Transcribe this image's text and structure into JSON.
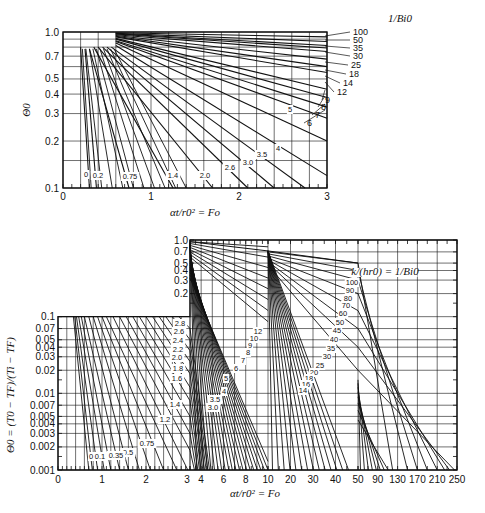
{
  "chart_data": [
    {
      "type": "line",
      "title": "Centerline temperature of an infinite cylinder (short time)",
      "xlabel": "αt/r0² = Fo",
      "ylabel": "Θ0",
      "xscale": "linear",
      "yscale": "log",
      "xlim": [
        0,
        3
      ],
      "ylim": [
        0.1,
        1.0
      ],
      "x_ticks": [
        "0",
        "1",
        "2",
        "3"
      ],
      "y_ticks": [
        "0.1",
        "0.2",
        "0.3",
        "0.4",
        "0.5",
        "0.7",
        "1.0"
      ],
      "legend_title": "1/Bi0",
      "grid": true,
      "series": [
        {
          "name": "0",
          "x": [
            0.2,
            0.3
          ],
          "values": [
            0.8,
            0.1
          ]
        },
        {
          "name": "0.2",
          "x": [
            0.25,
            0.38
          ],
          "values": [
            0.78,
            0.1
          ]
        },
        {
          "name": "0.75",
          "x": [
            0.3,
            0.75
          ],
          "values": [
            0.78,
            0.1
          ]
        },
        {
          "name": "1.4",
          "x": [
            0.35,
            1.25
          ],
          "values": [
            0.8,
            0.1
          ]
        },
        {
          "name": "2.0",
          "x": [
            0.4,
            1.7
          ],
          "values": [
            0.8,
            0.1
          ]
        },
        {
          "name": "2.6",
          "x": [
            0.45,
            2.1
          ],
          "values": [
            0.8,
            0.1
          ]
        },
        {
          "name": "3.0",
          "x": [
            0.5,
            2.4
          ],
          "values": [
            0.8,
            0.1
          ]
        },
        {
          "name": "3.5",
          "x": [
            0.55,
            2.75
          ],
          "values": [
            0.8,
            0.1
          ]
        },
        {
          "name": "4",
          "x": [
            0.6,
            3.0
          ],
          "values": [
            0.82,
            0.12
          ]
        },
        {
          "name": "5",
          "x": [
            0.6,
            3.0
          ],
          "values": [
            0.85,
            0.2
          ]
        },
        {
          "name": "6",
          "x": [
            0.6,
            3.0
          ],
          "values": [
            0.87,
            0.28
          ]
        },
        {
          "name": "7",
          "x": [
            0.6,
            3.0
          ],
          "values": [
            0.88,
            0.33
          ]
        },
        {
          "name": "8",
          "x": [
            0.6,
            3.0
          ],
          "values": [
            0.9,
            0.38
          ]
        },
        {
          "name": "9",
          "x": [
            0.6,
            3.0
          ],
          "values": [
            0.91,
            0.43
          ]
        },
        {
          "name": "12",
          "x": [
            0.6,
            3.0
          ],
          "values": [
            0.93,
            0.55
          ]
        },
        {
          "name": "14",
          "x": [
            0.6,
            3.0
          ],
          "values": [
            0.94,
            0.6
          ]
        },
        {
          "name": "18",
          "x": [
            0.6,
            3.0
          ],
          "values": [
            0.95,
            0.67
          ]
        },
        {
          "name": "25",
          "x": [
            0.6,
            3.0
          ],
          "values": [
            0.96,
            0.75
          ]
        },
        {
          "name": "30",
          "x": [
            0.6,
            3.0
          ],
          "values": [
            0.97,
            0.79
          ]
        },
        {
          "name": "35",
          "x": [
            0.6,
            3.0
          ],
          "values": [
            0.975,
            0.82
          ]
        },
        {
          "name": "50",
          "x": [
            0.6,
            3.0
          ],
          "values": [
            0.98,
            0.87
          ]
        },
        {
          "name": "100",
          "x": [
            0.6,
            3.0
          ],
          "values": [
            0.99,
            0.93
          ]
        }
      ]
    },
    {
      "type": "line",
      "title": "Centerline temperature of an infinite cylinder (full range)",
      "xlabel": "αt/r0² = Fo",
      "ylabel": "Θ0 = (T0 − TF)/(Ti − TF)",
      "xscale": "piecewise",
      "yscale": "log",
      "ylim": [
        0.001,
        1.0
      ],
      "x_ticks": [
        "0",
        "1",
        "2",
        "3",
        "4",
        "6",
        "8",
        "10",
        "20",
        "30",
        "40",
        "50",
        "90",
        "130",
        "170",
        "210",
        "250"
      ],
      "y_ticks": [
        "0.001",
        "0.002",
        "0.003",
        "0.004",
        "0.005",
        "0.007",
        "0.01",
        "0.02",
        "0.03",
        "0.04",
        "0.05",
        "0.07",
        "0.1",
        "0.2",
        "0.3",
        "0.4",
        "0.5",
        "0.7",
        "1.0"
      ],
      "legend_title": "k/(hr0) = 1/Bi0",
      "grid": true,
      "series_labels_left": [
        "0",
        "0.1",
        "0.35",
        "0.5",
        "0.75",
        "1.2",
        "1.4",
        "1.6",
        "1.8",
        "2.0",
        "2.2",
        "2.4",
        "2.6",
        "2.8"
      ],
      "series_labels_mid": [
        "3.0",
        "3.5",
        "4",
        "5",
        "6",
        "7",
        "8",
        "9",
        "10",
        "12"
      ],
      "series_labels_right": [
        "14",
        "16",
        "18",
        "20",
        "25",
        "30",
        "35",
        "40",
        "45",
        "50",
        "60",
        "70",
        "80",
        "90",
        "100"
      ]
    }
  ],
  "top": {
    "ylabel": "Θ0",
    "xlabel": "αt/r0² = Fo",
    "legend_title": "1/Bi0",
    "x_ticks": [
      "0",
      "1",
      "2",
      "3"
    ],
    "y_ticks": [
      "1.0",
      "0.7",
      "0.5",
      "0.4",
      "0.3",
      "0.2",
      "0.1"
    ],
    "right_labels": [
      "100",
      "50",
      "35",
      "30",
      "25",
      "18",
      "14",
      "12",
      "9",
      "8",
      "7",
      "6"
    ],
    "inner_labels": [
      "5",
      "4",
      "3.5",
      "3.0",
      "2.6",
      "2.0",
      "1.4",
      "0.75",
      "0.2",
      "0"
    ]
  },
  "bottom": {
    "ylabel": "Θ0 = (T0 − TF)/(Ti − TF)",
    "xlabel": "αt/r0² = Fo",
    "legend_title": "k/(hr0) = 1/Bi0",
    "x_ticks": [
      "0",
      "1",
      "2",
      "3",
      "4",
      "6",
      "8",
      "10",
      "20",
      "30",
      "40",
      "50",
      "90",
      "130",
      "170",
      "210",
      "250"
    ],
    "y_ticks_upper": [
      "1.0",
      "0.7",
      "0.5",
      "0.4",
      "0.3",
      "0.2"
    ],
    "y_ticks_lower": [
      "0.1",
      "0.07",
      "0.05",
      "0.04",
      "0.03",
      "0.02",
      "0.01",
      "0.007",
      "0.005",
      "0.004",
      "0.003",
      "0.002",
      "0.001"
    ]
  },
  "caption": "(a) ... (b) ... Full ... (c) ..."
}
